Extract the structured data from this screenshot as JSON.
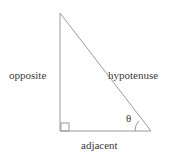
{
  "figure": {
    "type": "geometry-diagram",
    "background_color": "#ffffff",
    "stroke_color": "#9a9a9a",
    "text_color": "#3a3a3a"
  },
  "labels": {
    "opposite": "opposite",
    "hypotenuse": "hypotenuse",
    "adjacent": "adjacent",
    "theta": "θ"
  },
  "geometry": {
    "apex": {
      "x": 60,
      "y": 13
    },
    "right_angle_vertex": {
      "x": 60,
      "y": 131
    },
    "theta_vertex": {
      "x": 151,
      "y": 131
    },
    "right_angle_marker": {
      "x": 61,
      "y": 123,
      "size": 8
    },
    "angle_arc_radius": 16
  }
}
